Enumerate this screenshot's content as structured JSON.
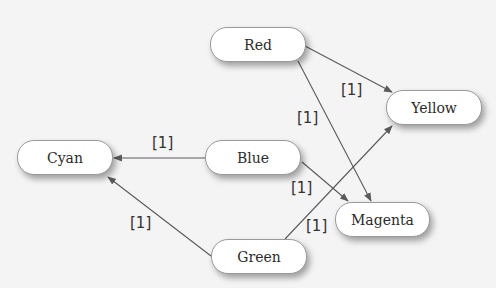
{
  "nodes": [
    {
      "id": "red",
      "label": "Red",
      "x": 210,
      "y": 27,
      "w": 96,
      "h": 35
    },
    {
      "id": "yellow",
      "label": "Yellow",
      "x": 386,
      "y": 90,
      "w": 96,
      "h": 35
    },
    {
      "id": "cyan",
      "label": "Cyan",
      "x": 17,
      "y": 140,
      "w": 96,
      "h": 35
    },
    {
      "id": "blue",
      "label": "Blue",
      "x": 205,
      "y": 140,
      "w": 96,
      "h": 35
    },
    {
      "id": "magenta",
      "label": "Magenta",
      "x": 335,
      "y": 202,
      "w": 95,
      "h": 35
    },
    {
      "id": "green",
      "label": "Green",
      "x": 211,
      "y": 239,
      "w": 96,
      "h": 35
    }
  ],
  "edges": [
    {
      "from": "red",
      "to": "yellow",
      "label": "[1]",
      "x1": 305,
      "y1": 46,
      "x2": 392,
      "y2": 92,
      "lx": 341,
      "ly": 83
    },
    {
      "from": "red",
      "to": "magenta",
      "label": "[1]",
      "x1": 298,
      "y1": 61,
      "x2": 371,
      "y2": 201,
      "lx": 297,
      "ly": 111
    },
    {
      "from": "blue",
      "to": "cyan",
      "label": "[1]",
      "x1": 205,
      "y1": 158,
      "x2": 114,
      "y2": 158,
      "lx": 152,
      "ly": 136
    },
    {
      "from": "blue",
      "to": "magenta",
      "label": "[1]",
      "x1": 302,
      "y1": 162,
      "x2": 348,
      "y2": 201,
      "lx": 291,
      "ly": 181
    },
    {
      "from": "green",
      "to": "yellow",
      "label": "[1]",
      "x1": 285,
      "y1": 239,
      "x2": 392,
      "y2": 126,
      "lx": 306,
      "ly": 219
    },
    {
      "from": "green",
      "to": "cyan",
      "label": "[1]",
      "x1": 211,
      "y1": 256,
      "x2": 108,
      "y2": 177,
      "lx": 130,
      "ly": 216
    }
  ],
  "colors": {
    "background": "#f4f4f4",
    "node_fill": "#ffffff",
    "node_border": "#9a9a9a",
    "edge": "#5a5a5a",
    "text": "#2b2b2b"
  }
}
